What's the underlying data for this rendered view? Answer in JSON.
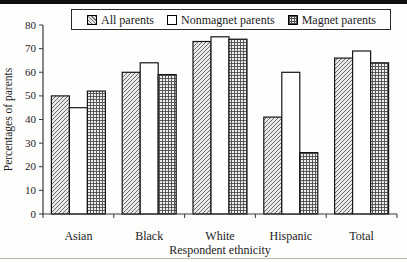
{
  "figure": {
    "kind": "scanned-journal-bar-chart"
  },
  "chart_data": {
    "type": "bar",
    "title": "",
    "xlabel": "Respondent ethnicity",
    "ylabel": "Percentages of parents",
    "categories": [
      "Asian",
      "Black",
      "White",
      "Hispanic",
      "Total"
    ],
    "series": [
      {
        "name": "All parents",
        "pattern": "diagonal-hatch",
        "values": [
          50,
          60,
          73,
          41,
          66
        ]
      },
      {
        "name": "Nonmagnet parents",
        "pattern": "solid-white",
        "values": [
          45,
          64,
          75,
          60,
          69
        ]
      },
      {
        "name": "Magnet parents",
        "pattern": "grid-crosshatch",
        "values": [
          52,
          59,
          74,
          26,
          64
        ]
      }
    ],
    "ylim": [
      0,
      80
    ],
    "ytick_step": 10,
    "yticks": [
      0,
      10,
      20,
      30,
      40,
      50,
      60,
      70,
      80
    ],
    "grid": false,
    "legend_position": "top",
    "colors": {
      "bar_border": "#161616",
      "axis": "#3a3a3a",
      "text": "#1c1c1c",
      "hatch_line": "#6e6e6e",
      "hatch_bg": "#e9e9e9",
      "grid_line": "#4d4d4d",
      "grid_bg": "#ededed",
      "nonmagnet_fill": "#ffffff"
    }
  }
}
